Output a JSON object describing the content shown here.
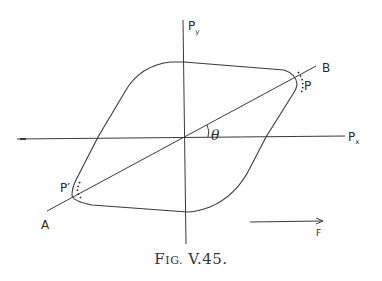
{
  "figure": {
    "caption_prefix": "F",
    "caption_smallcaps": "IG.",
    "caption_number": " V.45.",
    "labels": {
      "py_main": "P",
      "py_sub": "y",
      "px_main": "P",
      "px_sub": "x",
      "B": "B",
      "P": "P",
      "P_prime": "P′",
      "A": "A",
      "theta": "θ",
      "F": "F"
    },
    "colors": {
      "line": "#3a3a3a",
      "background": "#ffffff"
    }
  }
}
